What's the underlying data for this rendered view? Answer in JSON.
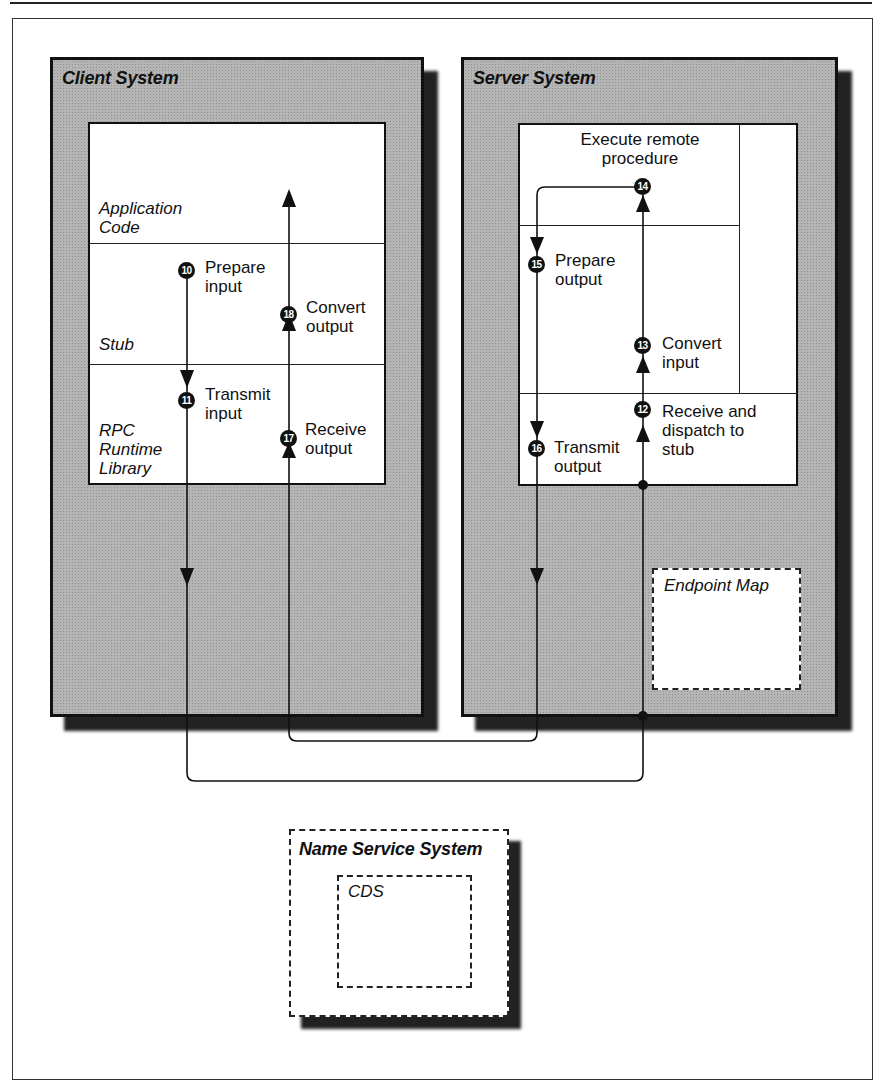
{
  "client_system": {
    "title": "Client System",
    "layers": {
      "application": "Application Code",
      "stub": "Stub",
      "runtime": "RPC Runtime Library"
    },
    "steps": [
      {
        "num": "10",
        "label_line1": "Prepare",
        "label_line2": "input"
      },
      {
        "num": "11",
        "label_line1": "Transmit",
        "label_line2": "input"
      },
      {
        "num": "17",
        "label_line1": "Receive",
        "label_line2": "output"
      },
      {
        "num": "18",
        "label_line1": "Convert",
        "label_line2": "output"
      }
    ]
  },
  "server_system": {
    "title": "Server System",
    "execute_line1": "Execute remote",
    "execute_line2": "procedure",
    "steps": [
      {
        "num": "12",
        "label_line1": "Receive and",
        "label_line2": "dispatch to",
        "label_line3": "stub"
      },
      {
        "num": "13",
        "label_line1": "Convert",
        "label_line2": "input"
      },
      {
        "num": "14"
      },
      {
        "num": "15",
        "label_line1": "Prepare",
        "label_line2": "output"
      },
      {
        "num": "16",
        "label_line1": "Transmit",
        "label_line2": "output"
      }
    ],
    "endpoint_map": "Endpoint Map"
  },
  "name_service": {
    "title": "Name Service System",
    "cds": "CDS"
  },
  "colors": {
    "system_fill": "#b5b5b5",
    "shadow": "#222222",
    "line": "#111111"
  }
}
